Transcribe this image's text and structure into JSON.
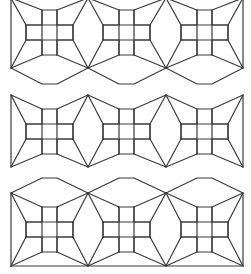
{
  "figure": {
    "stroke_color": "#3a3a3a",
    "background": "#ffffff",
    "unit_columns_x": [
      11,
      88,
      166,
      243
    ],
    "unit_centers_x": [
      50,
      127,
      205
    ],
    "cell_size": 15,
    "bands": [
      {
        "name": "top",
        "top_y": 0,
        "vertex_top_y": -2,
        "vertex_bottom_y": 68,
        "grid_rows_y": [
          10,
          25,
          40,
          55
        ],
        "hex_outer_y": 84,
        "hex_position": "below",
        "baseline": false
      },
      {
        "name": "middle",
        "vertex_top_y": 95,
        "vertex_bottom_y": 167,
        "grid_rows_y": [
          109,
          124,
          139,
          154
        ],
        "hex_position": "none",
        "baseline": false
      },
      {
        "name": "bottom",
        "vertex_top_y": 193,
        "vertex_bottom_y": 266,
        "grid_rows_y": [
          207,
          222,
          237,
          252
        ],
        "hex_outer_y": 178,
        "hex_position": "above",
        "baseline": true
      }
    ]
  }
}
